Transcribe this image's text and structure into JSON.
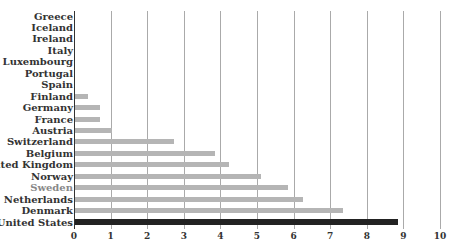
{
  "chart_data": {
    "type": "bar",
    "orientation": "horizontal",
    "title": "",
    "xlabel": "",
    "ylabel": "",
    "xlim": [
      0,
      10
    ],
    "x_ticks": [
      "0",
      "1",
      "2",
      "3",
      "4",
      "5",
      "6",
      "7",
      "8",
      "9",
      "10"
    ],
    "grid": true,
    "legend": null,
    "categories": [
      "Greece",
      "Iceland",
      "Ireland",
      "Italy",
      "Luxembourg",
      "Portugal",
      "Spain",
      "Finland",
      "Germany",
      "France",
      "Austria",
      "Switzerland",
      "Belgium",
      "United Kingdom",
      "Norway",
      "Sweden",
      "Netherlands",
      "Denmark",
      "United States"
    ],
    "values": [
      0,
      0,
      0,
      0,
      0,
      0,
      0,
      0.37,
      0.71,
      0.71,
      1.03,
      2.73,
      3.84,
      4.23,
      5.11,
      5.85,
      6.27,
      7.36,
      8.84
    ],
    "highlighted_bar": "United States",
    "highlighted_label": "Sweden",
    "colors": {
      "bar": "#b5b5b5",
      "highlight_bar": "#222222",
      "label": "#333333",
      "highlight_label": "#888888",
      "grid": "#aaaaaa"
    }
  }
}
